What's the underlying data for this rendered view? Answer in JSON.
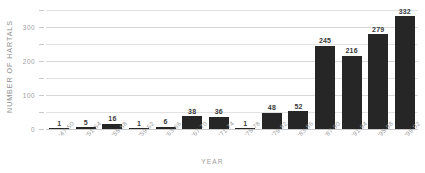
{
  "chart_data": {
    "type": "bar",
    "title": "",
    "xlabel": "YEAR",
    "ylabel": "NUMBER OF HARTALS",
    "categories": [
      "'47-50",
      "'51-54",
      "'55-58",
      "'59-62",
      "'63-66",
      "'67-70",
      "'71-74",
      "'75-78",
      "'79-82",
      "'83-86",
      "'87-90",
      "'91-94",
      "'95-98",
      "'99-02"
    ],
    "values": [
      1,
      5,
      16,
      1,
      6,
      38,
      36,
      1,
      48,
      52,
      245,
      216,
      279,
      332
    ],
    "ylim": [
      0,
      350
    ],
    "yticks": [
      0,
      50,
      100,
      150,
      200,
      250,
      300,
      350
    ],
    "ytick_labels": [
      "0",
      "",
      "100",
      "",
      "200",
      "",
      "300",
      ""
    ],
    "grid": true,
    "legend": "none",
    "bar_color": "#262626",
    "gridline_color": "#e2e2e2",
    "label_color": "#9a9a9a",
    "value_label_color": "#3a3a3a",
    "background": "#ffffff"
  }
}
